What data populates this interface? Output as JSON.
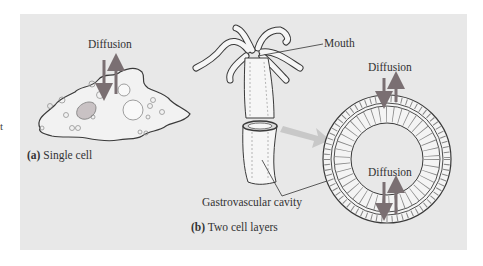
{
  "figure": {
    "panel_a": {
      "letter": "(a)",
      "caption": "Single cell",
      "diffusion_label": "Diffusion"
    },
    "panel_b": {
      "letter": "(b)",
      "caption": "Two cell layers",
      "mouth_label": "Mouth",
      "cavity_label": "Gastrovascular cavity",
      "diffusion_outer_label": "Diffusion",
      "diffusion_inner_label": "Diffusion"
    },
    "edge_fragment": "t",
    "colors": {
      "background": "#e8e8e8",
      "arrow": "#7a6f72",
      "outline": "#3a3a3a",
      "cell_fill": "#f4f4f4",
      "pointer_arrow": "#c8c8c8"
    }
  }
}
